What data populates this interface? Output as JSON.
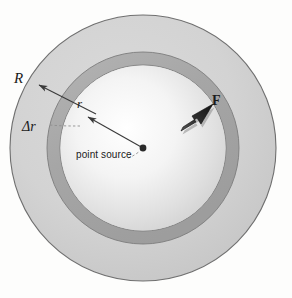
{
  "figure": {
    "background_color": "#fdfdfc",
    "center": {
      "x": 143,
      "y": 148
    },
    "labels": {
      "outer_radius": "R",
      "inner_radius": "r",
      "shell_thickness": "Δr",
      "force": "F",
      "point_source": "point source"
    },
    "geometry": {
      "outer_circle_radius": 133,
      "shell_outer_radius": 96,
      "shell_inner_radius": 83,
      "point_source_dot_radius": 3.2
    },
    "colors": {
      "outer_disk_fill": "#d2d2d2",
      "shell_band_fill": "#a9a9a9",
      "inner_disk_center": "#ffffff",
      "inner_disk_edge": "#d5d5d5",
      "outline": "#6f6f6f",
      "arrow_line": "#3a3a3a",
      "force_arrow": "#2b2b2b",
      "leader_dashed": "#8a8a8a",
      "text": "#1b1b1b"
    },
    "annotations": [
      {
        "name": "R",
        "type": "arrow",
        "from": {
          "x": 94,
          "y": 113
        },
        "to": {
          "x": 37,
          "y": 84
        }
      },
      {
        "name": "r",
        "type": "arrow",
        "from": {
          "x": 143,
          "y": 148
        },
        "to": {
          "x": 86,
          "y": 116
        }
      },
      {
        "name": "Δr",
        "type": "dashed-leader",
        "from": {
          "x": 52,
          "y": 124
        },
        "to": {
          "x": 80,
          "y": 126
        }
      },
      {
        "name": "point source",
        "type": "dashed-leader",
        "from": {
          "x": 132,
          "y": 157
        },
        "to": {
          "x": 143,
          "y": 148
        }
      },
      {
        "name": "F",
        "type": "block-arrow",
        "from": {
          "x": 183,
          "y": 129
        },
        "to": {
          "x": 216,
          "y": 103
        }
      }
    ]
  }
}
